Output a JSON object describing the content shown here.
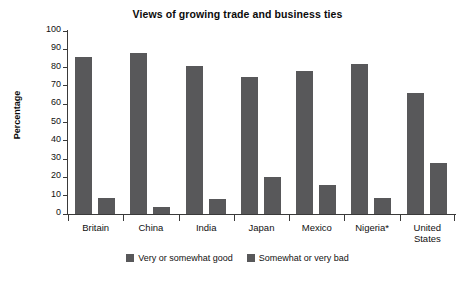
{
  "chart_data": {
    "type": "bar",
    "title": "Views of growing trade and business ties",
    "xlabel": "",
    "ylabel": "Percentage",
    "ylim": [
      0,
      100
    ],
    "ytick_step": 10,
    "yticks": [
      100,
      90,
      80,
      70,
      60,
      50,
      40,
      30,
      20,
      10,
      0
    ],
    "grid": false,
    "legend_position": "bottom-center",
    "categories": [
      "Britain",
      "China",
      "India",
      "Japan",
      "Mexico",
      "Nigeria*",
      "United States"
    ],
    "series": [
      {
        "name": "Very or somewhat good",
        "color": "#58585a",
        "values": [
          86,
          88,
          81,
          75,
          78,
          82,
          66
        ]
      },
      {
        "name": "Somewhat or very bad",
        "color": "#58585a",
        "values": [
          9,
          4,
          8,
          20,
          16,
          9,
          28
        ]
      }
    ],
    "annotations": [
      "*"
    ]
  },
  "colors": {
    "bar": "#58585a",
    "axis": "#3a3a3a",
    "text": "#111111",
    "background": "#ffffff"
  }
}
